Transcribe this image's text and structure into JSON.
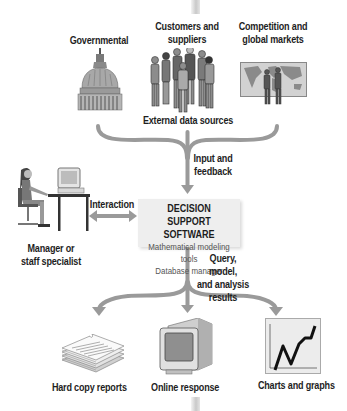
{
  "sources": {
    "governmental": "Governmental",
    "customers_line1": "Customers and",
    "customers_line2": "suppliers",
    "competition_line1": "Competition and",
    "competition_line2": "global markets",
    "group_label": "External data sources"
  },
  "flow": {
    "input_line1": "Input and",
    "input_line2": "feedback",
    "interaction": "Interaction",
    "query_line1": "Query, model,",
    "query_line2": "and analysis",
    "query_line3": "results"
  },
  "dss": {
    "title_line1": "DECISION SUPPORT",
    "title_line2": "SOFTWARE",
    "component1": "Mathematical modeling tools",
    "component2": "Database manager"
  },
  "user": {
    "line1": "Manager or",
    "line2": "staff specialist"
  },
  "outputs": {
    "hard_copy": "Hard copy reports",
    "online": "Online response",
    "charts": "Charts and graphs"
  },
  "colors": {
    "arrow": "#9a9a9a",
    "box": "#eeeeee"
  }
}
